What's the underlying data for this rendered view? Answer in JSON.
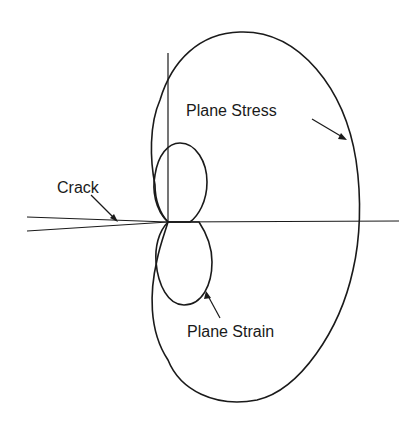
{
  "diagram": {
    "type": "crack-tip plastic zone shapes",
    "labels": {
      "crack": "Crack",
      "plane_stress": "Plane Stress",
      "plane_strain": "Plane Strain"
    },
    "colors": {
      "line": "#1a1a1a",
      "background": "#ffffff"
    }
  }
}
